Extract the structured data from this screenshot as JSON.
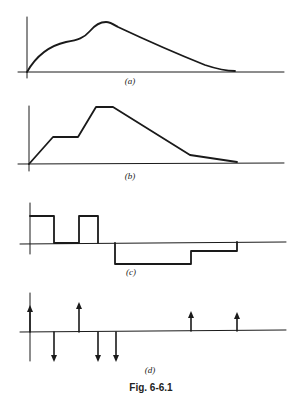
{
  "figure": {
    "caption": "Fig. 6-6.1",
    "panels": [
      {
        "id": "a",
        "label": "(a)",
        "type": "smooth-curve",
        "description": "Smooth waveform rising from origin, shoulder, peak, then decaying to zero"
      },
      {
        "id": "b",
        "label": "(b)",
        "type": "piecewise-linear",
        "points": [
          [
            0,
            0
          ],
          [
            1,
            0.5
          ],
          [
            2,
            0.5
          ],
          [
            2.7,
            1
          ],
          [
            3.4,
            1
          ],
          [
            6.5,
            0.1
          ],
          [
            8.4,
            0
          ]
        ]
      },
      {
        "id": "c",
        "label": "(c)",
        "type": "step-function",
        "segments": [
          {
            "from": 0,
            "to": 1,
            "level": "high"
          },
          {
            "from": 1,
            "to": 2,
            "level": "zero"
          },
          {
            "from": 2,
            "to": 2.7,
            "level": "high"
          },
          {
            "from": 2.7,
            "to": 3.4,
            "level": "zero"
          },
          {
            "from": 3.4,
            "to": 6.5,
            "level": "low"
          },
          {
            "from": 6.5,
            "to": 8.4,
            "level": "mid-low"
          }
        ]
      },
      {
        "id": "d",
        "label": "(d)",
        "type": "impulse-train",
        "impulses": [
          {
            "x": 0,
            "dir": "up"
          },
          {
            "x": 1,
            "dir": "down"
          },
          {
            "x": 2,
            "dir": "up"
          },
          {
            "x": 2.7,
            "dir": "down"
          },
          {
            "x": 3.4,
            "dir": "down"
          },
          {
            "x": 6.5,
            "dir": "up"
          },
          {
            "x": 8.4,
            "dir": "up"
          }
        ]
      }
    ]
  },
  "labels": {
    "a": "(a)",
    "b": "(b)",
    "c": "(c)",
    "d": "(d)",
    "caption": "Fig. 6-6.1"
  },
  "colors": {
    "ink": "#1a1a1a",
    "background": "#ffffff"
  }
}
